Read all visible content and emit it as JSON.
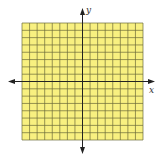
{
  "diagram": {
    "type": "coordinate-plane-grid",
    "x_axis_label": "x",
    "y_axis_label": "y",
    "grid": {
      "columns": 16,
      "rows": 16,
      "columns_left_of_y_axis": 8,
      "rows_above_x_axis": 8
    },
    "colors": {
      "grid_fill": "#f8f080",
      "grid_line": "#6b6a3a",
      "axis": "#222222",
      "background": "#ffffff"
    }
  }
}
